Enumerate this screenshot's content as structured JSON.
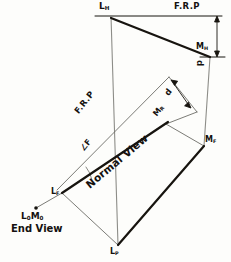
{
  "drawing": {
    "title": "Descriptive geometry construction: normal view and end view of line LM",
    "ink_color": "#17140f",
    "thin_color": "#4a4a46",
    "background": "#fdfdfb"
  },
  "labels": {
    "l_h": {
      "base": "L",
      "sub": "H"
    },
    "m_h": {
      "base": "M",
      "sub": "H"
    },
    "m_f": {
      "base": "M",
      "sub": "F"
    },
    "m_r": {
      "base": "M",
      "sub": "R"
    },
    "l_f": {
      "base": "L",
      "sub": "F"
    },
    "l_p": {
      "base": "L",
      "sub": "P"
    },
    "frp_top": "F.R.P",
    "frp_diagonal": "F.R.P",
    "dimension_top": "d",
    "dimension_middle": "d",
    "angle_f": "∠F",
    "normal_view": "Normal View",
    "end_view_point": {
      "first_base": "L",
      "first_sub": "0",
      "second_base": "M",
      "second_sub": "0"
    },
    "end_view_caption": "End View"
  },
  "geometry": {
    "points": {
      "L_H": [
        111,
        16
      ],
      "M_H": [
        210,
        57
      ],
      "M_F": [
        204,
        146
      ],
      "M_R": [
        166,
        124
      ],
      "L_F": [
        62,
        193
      ],
      "L_P": [
        118,
        245
      ],
      "end_view_point": [
        36,
        208
      ]
    },
    "notes": {
      "frp_top_line_y": 16,
      "thick_line_top": "L_H to M_H",
      "thick_line_normal": "L_F to M_R",
      "thick_line_lower": "L_P to M_F",
      "projector_vertical_left": "L_H down to L_P",
      "projector_vertical_right": "M_H down to M_F"
    }
  }
}
